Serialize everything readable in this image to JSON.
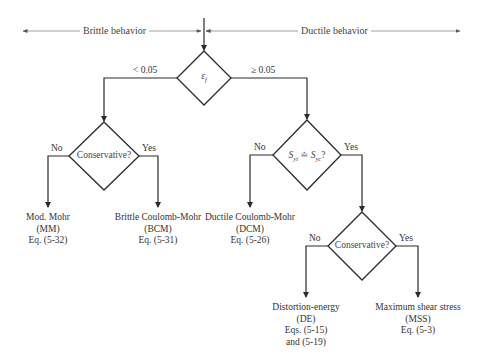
{
  "header": {
    "left_label": "Brittle behavior",
    "right_label": "Ductile behavior"
  },
  "decisions": {
    "strain": {
      "symbol": "ε",
      "subscript": "f",
      "left_branch": "< 0.05",
      "right_branch": "≥ 0.05"
    },
    "brittle_conservative": {
      "text": "Conservative?",
      "no": "No",
      "yes": "Yes"
    },
    "strength_equal": {
      "s1": "S",
      "s1_sub": "yt",
      "op": "≐",
      "s2": "S",
      "s2_sub": "yc",
      "q": "?",
      "no": "No",
      "yes": "Yes"
    },
    "ductile_conservative": {
      "text": "Conservative?",
      "no": "No",
      "yes": "Yes"
    }
  },
  "outcomes": {
    "mm": {
      "name": "Mod. Mohr",
      "abbr": "(MM)",
      "eq": "Eq. (5-32)"
    },
    "bcm": {
      "name": "Brittle Coulomb-Mohr",
      "abbr": "(BCM)",
      "eq": "Eq. (5-31)"
    },
    "dcm": {
      "name": "Ductile Coulomb-Mohr",
      "abbr": "(DCM)",
      "eq": "Eq. (5-26)"
    },
    "de": {
      "name": "Distortion-energy",
      "abbr": "(DE)",
      "eq": "Eqs. (5-15)",
      "eq2": "and (5-19)"
    },
    "mss": {
      "name": "Maximum shear stress",
      "abbr": "(MSS)",
      "eq": "Eq. (5-3)"
    }
  },
  "colors": {
    "line": "#2b2b2b",
    "thin_line": "#777777",
    "text": "#333333"
  }
}
